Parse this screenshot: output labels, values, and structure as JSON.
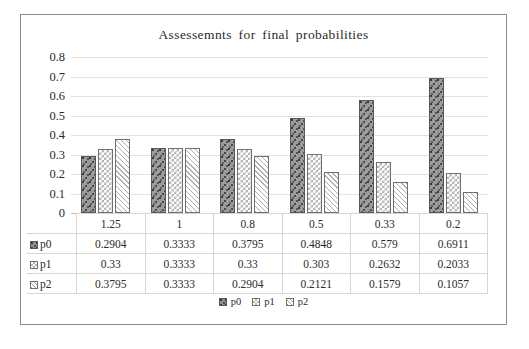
{
  "chart_data": {
    "type": "bar",
    "title": "Assessemnts  for final  probabilities",
    "xlabel": "",
    "ylabel": "",
    "ylim": [
      0,
      0.8
    ],
    "ytick_labels": [
      "0.8",
      "0.7",
      "0.6",
      "0.5",
      "0.4",
      "0.3",
      "0.2",
      "0.1",
      "0"
    ],
    "ytick_values": [
      0.8,
      0.7,
      0.6,
      0.5,
      0.4,
      0.3,
      0.2,
      0.1,
      0
    ],
    "grid": true,
    "legend_position": "bottom",
    "categories": [
      "1.25",
      "1",
      "0.8",
      "0.5",
      "0.33",
      "0.2"
    ],
    "series": [
      {
        "name": "p0",
        "pattern": "speckle",
        "color": "#8f8f8f",
        "values": [
          0.2904,
          0.3333,
          0.3795,
          0.4848,
          0.579,
          0.6911
        ],
        "labels": [
          "0.2904",
          "0.3333",
          "0.3795",
          "0.4848",
          "0.579",
          "0.6911"
        ]
      },
      {
        "name": "p1",
        "pattern": "checker",
        "color": "#b4b4b4",
        "values": [
          0.33,
          0.3333,
          0.33,
          0.303,
          0.2632,
          0.2033
        ],
        "labels": [
          "0.33",
          "0.3333",
          "0.33",
          "0.303",
          "0.2632",
          "0.2033"
        ]
      },
      {
        "name": "p2",
        "pattern": "diagonal-hatch",
        "color": "#b0b0b0",
        "values": [
          0.3795,
          0.3333,
          0.2904,
          0.2121,
          0.1579,
          0.1057
        ],
        "labels": [
          "0.3795",
          "0.3333",
          "0.2904",
          "0.2121",
          "0.1579",
          "0.1057"
        ]
      }
    ],
    "data_table": {
      "header_row": [
        "",
        "1.25",
        "1",
        "0.8",
        "0.5",
        "0.33",
        "0.2"
      ],
      "rows": [
        {
          "label": "p0",
          "cells": [
            "0.2904",
            "0.3333",
            "0.3795",
            "0.4848",
            "0.579",
            "0.6911"
          ]
        },
        {
          "label": "p1",
          "cells": [
            "0.33",
            "0.3333",
            "0.33",
            "0.303",
            "0.2632",
            "0.2033"
          ]
        },
        {
          "label": "p2",
          "cells": [
            "0.3795",
            "0.3333",
            "0.2904",
            "0.2121",
            "0.1579",
            "0.1057"
          ]
        }
      ]
    },
    "legend": [
      "p0",
      "p1",
      "p2"
    ]
  }
}
